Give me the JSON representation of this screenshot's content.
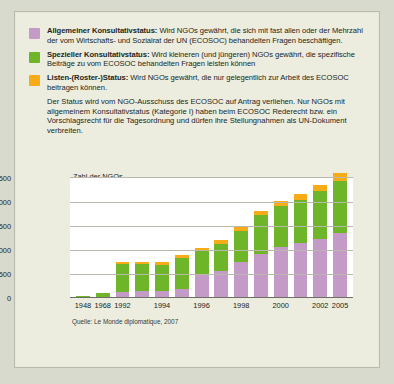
{
  "legend": {
    "items": [
      {
        "color": "#c49ac6",
        "title": "Allgemeiner Konsultativstatus:",
        "desc": " Wird NGOs gewährt, die sich mit fast allen oder der Mehrzahl der vom Wirtschafts- und Sozialrat der UN (ECOSOC) behandelten Fragen beschäftigen."
      },
      {
        "color": "#6fb52a",
        "title": "Spezieller Konsultativstatus:",
        "desc": " Wird kleineren (und jüngeren) NGOs gewährt, die spezifische Beiträge zu vom ECOSOC behandelten Fragen leisten können"
      },
      {
        "color": "#f7ab17",
        "title": "Listen-(Roster-)Status:",
        "desc": " Wird NGOs gewährt, die nur gelegentlich zur Arbeit des ECOSOC beitragen können."
      }
    ],
    "note": "Der Status wird vom NGO-Ausschuss des ECOSOC auf Antrag verliehen. Nur NGOs mit allgemeinem Konsultativstatus (Kategorie I) haben beim ECOSOC Rederecht bzw. ein Vorschlagsrecht für die Tagesordnung und dürfen ihre Stellungnahmen als UN-Dokument verbreiten."
  },
  "chart_data": {
    "type": "bar",
    "stacked": true,
    "title": "",
    "ylabel": "Zahl der NGOs",
    "xlabel": "",
    "ylim": [
      0,
      2500
    ],
    "yticks": [
      0,
      500,
      1000,
      1500,
      2000,
      2500
    ],
    "ytick_labels": [
      "0",
      "500",
      "1000",
      "1500",
      "2000",
      "2500"
    ],
    "grid": true,
    "legend_position": "top",
    "categories": [
      "1948",
      "1968",
      "1992",
      "1993",
      "1994",
      "1995",
      "1996",
      "1997",
      "1998",
      "1999",
      "2000",
      "2001",
      "2002",
      "2005"
    ],
    "tick_labels": [
      "1948",
      "1968",
      "1992",
      "",
      "1994",
      "",
      "1996",
      "",
      "1998",
      "",
      "2000",
      "",
      "2002",
      "2005"
    ],
    "series": [
      {
        "name": "Allgemeiner Konsultativstatus",
        "color": "#c49ac6",
        "values": [
          30,
          30,
          130,
          140,
          150,
          190,
          480,
          560,
          750,
          920,
          1060,
          1150,
          1230,
          1350
        ]
      },
      {
        "name": "Spezieller Konsultativstatus",
        "color": "#6fb52a",
        "values": [
          10,
          70,
          570,
          560,
          545,
          635,
          500,
          575,
          650,
          800,
          855,
          895,
          990,
          1090
        ]
      },
      {
        "name": "Listen-(Roster-)Status",
        "color": "#f7ab17",
        "values": [
          0,
          0,
          50,
          50,
          50,
          70,
          60,
          70,
          90,
          90,
          100,
          120,
          130,
          160
        ]
      }
    ],
    "totals": [
      40,
      100,
      750,
      750,
      745,
      895,
      1040,
      1205,
      1490,
      1810,
      2015,
      2165,
      2350,
      2600
    ],
    "source": "Quelle: Le Monde diplomatique, 2007"
  }
}
